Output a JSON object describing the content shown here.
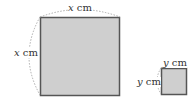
{
  "diagram": {
    "large_square": {
      "top_label_var": "x",
      "top_label_unit": "cm",
      "side_label_var": "x",
      "side_label_unit": "cm"
    },
    "small_square": {
      "top_label_var": "y",
      "top_label_unit": "cm",
      "side_label_var": "y",
      "side_label_unit": "cm"
    },
    "colors": {
      "fill": "#cfcfcf",
      "stroke": "#555555",
      "dash": "#999999"
    }
  }
}
